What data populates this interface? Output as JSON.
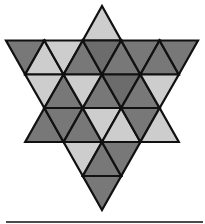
{
  "figure": {
    "colors": {
      "light": "#cdcdcd",
      "dark": "#787878",
      "darker": "#6c6c6c",
      "stroke": "#111111",
      "rule": "#4a4a4a"
    },
    "stroke_width": 2.2,
    "triangles": [
      {
        "row": 1,
        "dir": "up",
        "points": [
          [
            102,
            6
          ],
          [
            82.8,
            40.5
          ],
          [
            121.2,
            40.5
          ]
        ],
        "shade": "light"
      },
      {
        "row": 2,
        "dir": "down",
        "points": [
          [
            6,
            40.5
          ],
          [
            44.4,
            40.5
          ],
          [
            25.2,
            74.5
          ]
        ],
        "shade": "dark"
      },
      {
        "row": 2,
        "dir": "up",
        "points": [
          [
            25.2,
            74.5
          ],
          [
            63.6,
            74.5
          ],
          [
            44.4,
            40.5
          ]
        ],
        "shade": "light"
      },
      {
        "row": 2,
        "dir": "down",
        "points": [
          [
            44.4,
            40.5
          ],
          [
            82.8,
            40.5
          ],
          [
            63.6,
            74.5
          ]
        ],
        "shade": "light"
      },
      {
        "row": 2,
        "dir": "up",
        "points": [
          [
            63.6,
            74.5
          ],
          [
            102,
            74.5
          ],
          [
            82.8,
            40.5
          ]
        ],
        "shade": "dark"
      },
      {
        "row": 2,
        "dir": "down",
        "points": [
          [
            82.8,
            40.5
          ],
          [
            121.2,
            40.5
          ],
          [
            102,
            74.5
          ]
        ],
        "shade": "darker"
      },
      {
        "row": 2,
        "dir": "up",
        "points": [
          [
            102,
            74.5
          ],
          [
            140.4,
            74.5
          ],
          [
            121.2,
            40.5
          ]
        ],
        "shade": "dark"
      },
      {
        "row": 2,
        "dir": "down",
        "points": [
          [
            121.2,
            40.5
          ],
          [
            159.6,
            40.5
          ],
          [
            140.4,
            74.5
          ]
        ],
        "shade": "dark"
      },
      {
        "row": 2,
        "dir": "up",
        "points": [
          [
            140.4,
            74.5
          ],
          [
            178.8,
            74.5
          ],
          [
            159.6,
            40.5
          ]
        ],
        "shade": "dark"
      },
      {
        "row": 2,
        "dir": "down",
        "points": [
          [
            159.6,
            40.5
          ],
          [
            198,
            40.5
          ],
          [
            178.8,
            74.5
          ]
        ],
        "shade": "dark"
      },
      {
        "row": 3,
        "dir": "down",
        "points": [
          [
            25.2,
            74.5
          ],
          [
            63.6,
            74.5
          ],
          [
            44.4,
            108
          ]
        ],
        "shade": "light"
      },
      {
        "row": 3,
        "dir": "up",
        "points": [
          [
            44.4,
            108
          ],
          [
            82.8,
            108
          ],
          [
            63.6,
            74.5
          ]
        ],
        "shade": "dark"
      },
      {
        "row": 3,
        "dir": "down",
        "points": [
          [
            63.6,
            74.5
          ],
          [
            102,
            74.5
          ],
          [
            82.8,
            108
          ]
        ],
        "shade": "light"
      },
      {
        "row": 3,
        "dir": "up",
        "points": [
          [
            82.8,
            108
          ],
          [
            121.2,
            108
          ],
          [
            102,
            74.5
          ]
        ],
        "shade": "dark"
      },
      {
        "row": 3,
        "dir": "down",
        "points": [
          [
            102,
            74.5
          ],
          [
            140.4,
            74.5
          ],
          [
            121.2,
            108
          ]
        ],
        "shade": "darker"
      },
      {
        "row": 3,
        "dir": "up",
        "points": [
          [
            121.2,
            108
          ],
          [
            159.6,
            108
          ],
          [
            140.4,
            74.5
          ]
        ],
        "shade": "dark"
      },
      {
        "row": 3,
        "dir": "down",
        "points": [
          [
            140.4,
            74.5
          ],
          [
            178.8,
            74.5
          ],
          [
            159.6,
            108
          ]
        ],
        "shade": "light"
      },
      {
        "row": 4,
        "dir": "up",
        "points": [
          [
            25.2,
            142
          ],
          [
            63.6,
            142
          ],
          [
            44.4,
            108
          ]
        ],
        "shade": "dark"
      },
      {
        "row": 4,
        "dir": "down",
        "points": [
          [
            44.4,
            108
          ],
          [
            82.8,
            108
          ],
          [
            63.6,
            142
          ]
        ],
        "shade": "dark"
      },
      {
        "row": 4,
        "dir": "up",
        "points": [
          [
            63.6,
            142
          ],
          [
            102,
            142
          ],
          [
            82.8,
            108
          ]
        ],
        "shade": "dark"
      },
      {
        "row": 4,
        "dir": "down",
        "points": [
          [
            82.8,
            108
          ],
          [
            121.2,
            108
          ],
          [
            102,
            142
          ]
        ],
        "shade": "light"
      },
      {
        "row": 4,
        "dir": "up",
        "points": [
          [
            102,
            142
          ],
          [
            140.4,
            142
          ],
          [
            121.2,
            108
          ]
        ],
        "shade": "light"
      },
      {
        "row": 4,
        "dir": "down",
        "points": [
          [
            121.2,
            108
          ],
          [
            159.6,
            108
          ],
          [
            140.4,
            142
          ]
        ],
        "shade": "dark"
      },
      {
        "row": 4,
        "dir": "up",
        "points": [
          [
            140.4,
            142
          ],
          [
            178.8,
            142
          ],
          [
            159.6,
            108
          ]
        ],
        "shade": "light"
      },
      {
        "row": 5,
        "dir": "down",
        "points": [
          [
            63.6,
            142
          ],
          [
            102,
            142
          ],
          [
            82.8,
            176
          ]
        ],
        "shade": "light"
      },
      {
        "row": 5,
        "dir": "up",
        "points": [
          [
            82.8,
            176
          ],
          [
            121.2,
            176
          ],
          [
            102,
            142
          ]
        ],
        "shade": "dark"
      },
      {
        "row": 5,
        "dir": "down",
        "points": [
          [
            102,
            142
          ],
          [
            140.4,
            142
          ],
          [
            121.2,
            176
          ]
        ],
        "shade": "dark"
      },
      {
        "row": 6,
        "dir": "down",
        "points": [
          [
            82.8,
            176
          ],
          [
            121.2,
            176
          ],
          [
            102,
            210
          ]
        ],
        "shade": "dark"
      }
    ]
  }
}
